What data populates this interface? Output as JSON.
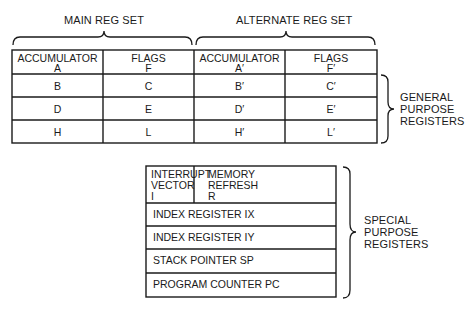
{
  "diagram": {
    "main_set_label": "MAIN REG SET",
    "alternate_set_label": "ALTERNATE REG SET",
    "general_purpose_label": [
      "GENERAL",
      "PURPOSE",
      "REGISTERS"
    ],
    "special_purpose_label": [
      "SPECIAL",
      "PURPOSE",
      "REGISTERS"
    ],
    "general_registers": {
      "header": [
        {
          "line1": "ACCUMULATOR",
          "line2": "A"
        },
        {
          "line1": "FLAGS",
          "line2": "F"
        },
        {
          "line1": "ACCUMULATOR",
          "line2": "A′"
        },
        {
          "line1": "FLAGS",
          "line2": "F′"
        }
      ],
      "rows": [
        [
          "B",
          "C",
          "B′",
          "C′"
        ],
        [
          "D",
          "E",
          "D′",
          "E′"
        ],
        [
          "H",
          "L",
          "H′",
          "L′"
        ]
      ]
    },
    "special_registers": {
      "interrupt_vector": {
        "line1": "INTERRUPT",
        "line2": "VECTOR",
        "line3": "I"
      },
      "memory_refresh": {
        "line1": "MEMORY",
        "line2": "REFRESH",
        "line3": "R"
      },
      "rows": [
        "INDEX REGISTER IX",
        "INDEX REGISTER IY",
        "STACK POINTER SP",
        "PROGRAM COUNTER PC"
      ]
    }
  }
}
